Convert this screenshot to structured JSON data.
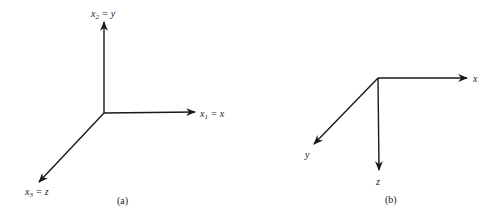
{
  "figures": [
    {
      "caption": "(a)",
      "axes": [
        {
          "var": "x",
          "sub": "2",
          "eq": " = y",
          "direction": "up"
        },
        {
          "var": "x",
          "sub": "1",
          "eq": " = x",
          "direction": "right"
        },
        {
          "var": "x",
          "sub": "3",
          "eq": " = z",
          "direction": "down-left"
        }
      ]
    },
    {
      "caption": "(b)",
      "axes": [
        {
          "label": "x",
          "direction": "right"
        },
        {
          "label": "z",
          "direction": "down"
        },
        {
          "label": "y",
          "direction": "down-left"
        }
      ]
    }
  ]
}
